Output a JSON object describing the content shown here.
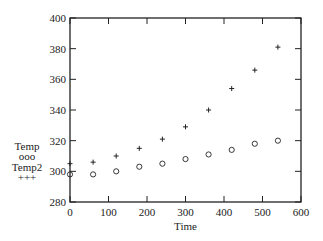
{
  "chart_data": {
    "type": "scatter",
    "title": "",
    "xlabel": "Time",
    "ylabel": "",
    "xlim": [
      0,
      600
    ],
    "ylim": [
      280,
      400
    ],
    "x_ticks": [
      0,
      100,
      200,
      300,
      400,
      500,
      600
    ],
    "y_ticks": [
      280,
      300,
      320,
      340,
      360,
      380,
      400
    ],
    "grid": false,
    "legend_position": "left",
    "x": [
      0,
      60,
      120,
      180,
      240,
      300,
      360,
      420,
      480,
      540
    ],
    "series": [
      {
        "name": "Temp",
        "marker": "ooo",
        "values": [
          298,
          298,
          300,
          303,
          305,
          308,
          311,
          314,
          318,
          320
        ]
      },
      {
        "name": "Temp2",
        "marker": "+++",
        "values": [
          305,
          306,
          310,
          315,
          321,
          329,
          340,
          354,
          366,
          381
        ]
      }
    ]
  }
}
